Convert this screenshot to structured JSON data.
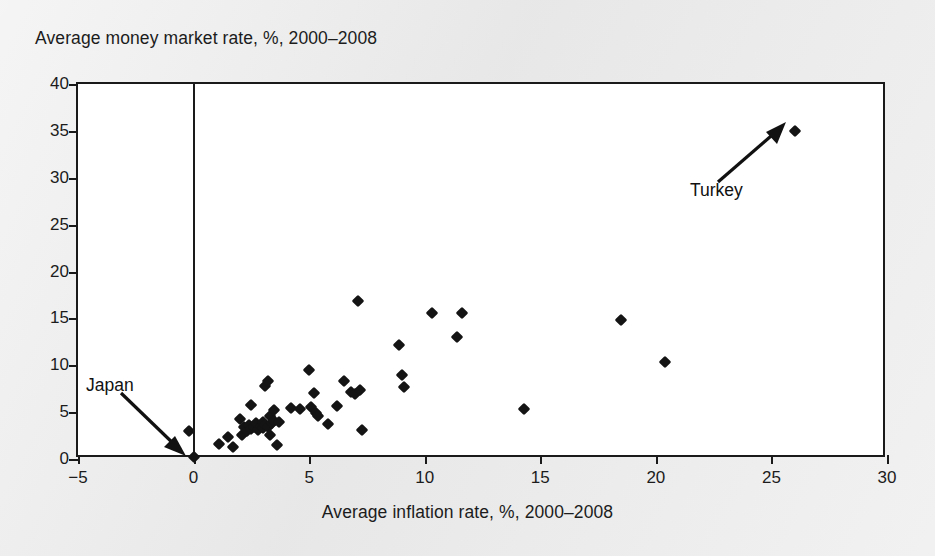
{
  "chart_data": {
    "type": "scatter",
    "title": "",
    "xlabel": "Average inflation rate, %, 2000–2008",
    "ylabel": "Average money market rate, %, 2000–2008",
    "xlim": [
      -5,
      30
    ],
    "ylim": [
      0,
      40
    ],
    "xticks": [
      -5,
      0,
      5,
      10,
      15,
      20,
      25,
      30
    ],
    "yticks": [
      0,
      5,
      10,
      15,
      20,
      25,
      30,
      35,
      40
    ],
    "xtick_labels": [
      "−5",
      "0",
      "5",
      "10",
      "15",
      "20",
      "25",
      "30"
    ],
    "ytick_labels": [
      "0",
      "5",
      "10",
      "15",
      "20",
      "25",
      "30",
      "35",
      "40"
    ],
    "grid": false,
    "legend": false,
    "marker": "diamond",
    "marker_color": "#141414",
    "reference_lines": [
      {
        "axis": "x",
        "value": 0
      }
    ],
    "annotations": [
      {
        "text": "Japan",
        "points_to_x": 0.0,
        "points_to_y": 0.2
      },
      {
        "text": "Turkey",
        "points_to_x": 26.0,
        "points_to_y": 35.0
      }
    ],
    "points": [
      [
        -0.2,
        3.0
      ],
      [
        0.0,
        0.2
      ],
      [
        1.1,
        1.6
      ],
      [
        1.5,
        2.3
      ],
      [
        1.7,
        1.3
      ],
      [
        2.0,
        4.3
      ],
      [
        2.1,
        2.6
      ],
      [
        2.2,
        3.4
      ],
      [
        2.3,
        3.0
      ],
      [
        2.4,
        3.6
      ],
      [
        2.5,
        3.2
      ],
      [
        2.5,
        5.8
      ],
      [
        2.6,
        3.4
      ],
      [
        2.7,
        3.8
      ],
      [
        2.8,
        3.1
      ],
      [
        2.9,
        3.5
      ],
      [
        3.0,
        3.3
      ],
      [
        3.0,
        4.0
      ],
      [
        3.1,
        3.6
      ],
      [
        3.1,
        7.8
      ],
      [
        3.2,
        3.4
      ],
      [
        3.2,
        8.3
      ],
      [
        3.3,
        2.6
      ],
      [
        3.3,
        4.6
      ],
      [
        3.4,
        3.8
      ],
      [
        3.5,
        5.2
      ],
      [
        3.5,
        4.1
      ],
      [
        3.6,
        1.5
      ],
      [
        3.7,
        3.9
      ],
      [
        4.2,
        5.4
      ],
      [
        4.6,
        5.3
      ],
      [
        5.0,
        9.5
      ],
      [
        5.1,
        5.6
      ],
      [
        5.2,
        7.0
      ],
      [
        5.3,
        4.9
      ],
      [
        5.4,
        4.6
      ],
      [
        5.8,
        3.7
      ],
      [
        6.2,
        5.7
      ],
      [
        6.5,
        8.3
      ],
      [
        6.8,
        7.1
      ],
      [
        7.0,
        6.9
      ],
      [
        7.1,
        16.9
      ],
      [
        7.2,
        7.4
      ],
      [
        7.3,
        3.1
      ],
      [
        8.9,
        12.2
      ],
      [
        9.0,
        9.0
      ],
      [
        9.1,
        7.7
      ],
      [
        10.3,
        15.6
      ],
      [
        11.4,
        13.0
      ],
      [
        11.6,
        15.6
      ],
      [
        14.3,
        5.3
      ],
      [
        18.5,
        14.8
      ],
      [
        20.4,
        10.4
      ],
      [
        26.0,
        35.0
      ]
    ]
  }
}
